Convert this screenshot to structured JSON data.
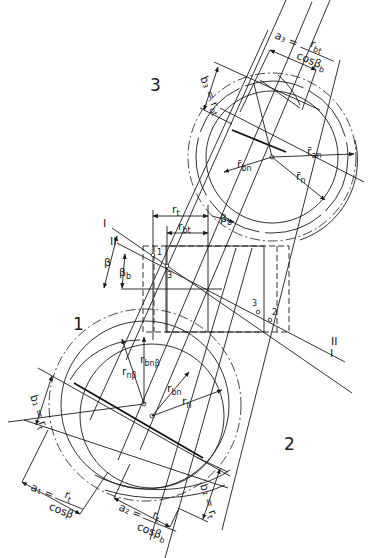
{
  "figure": {
    "type": "helical gear geometry construction",
    "region_labels": [
      "1",
      "2",
      "3"
    ],
    "section_lines": [
      "I",
      "II"
    ],
    "point_markers": [
      "1",
      "2",
      "3",
      "3"
    ]
  },
  "labels": {
    "region1": "1",
    "region2": "2",
    "region3": "3",
    "line_I_top": "I",
    "line_II_top": "II",
    "line_I_bottom": "I",
    "line_II_bottom": "II",
    "pt1": "1",
    "pt2": "2",
    "pt3a": "3",
    "pt3b": "3",
    "beta": "β",
    "beta_b": "β",
    "beta_b_sub": "b",
    "beta_b_top": "β",
    "beta_b_top_sub": "b",
    "r_t": "r",
    "r_t_sub": "t",
    "r_bt": "r",
    "r_bt_sub": "bt",
    "a3_lhs": "a₃ =",
    "a3_num": "r",
    "a3_num_sub": "bt",
    "a3_den": "cosβ",
    "a3_den_sub": "b",
    "b3": "b₃ = r",
    "b3_sub": "bt",
    "rbn_bar": "r̄",
    "rbn_bar_sub": "bn",
    "ran_bar": "r̄",
    "ran_bar_sub": "an",
    "rn_bar": "r̄",
    "rn_bar_sub": "n",
    "rbnbeta": "r",
    "rbnbeta_sub": "bnβ",
    "rnbeta": "r",
    "rnbeta_sub": "nβ",
    "rbn": "r",
    "rbn_sub": "bn",
    "rn": "r",
    "rn_sub": "n",
    "b1": "b₁ = r",
    "b1_sub": "t",
    "a1_lhs": "a₁ =",
    "a1_num": "r",
    "a1_num_sub": "t",
    "a1_den": "cosβ",
    "a2_lhs": "a₂ =",
    "a2_num": "r",
    "a2_num_sub": "t",
    "a2_den": "cosβ",
    "a2_den_sub": "b",
    "b2": "b₂ = r",
    "b2_sub": "t"
  }
}
